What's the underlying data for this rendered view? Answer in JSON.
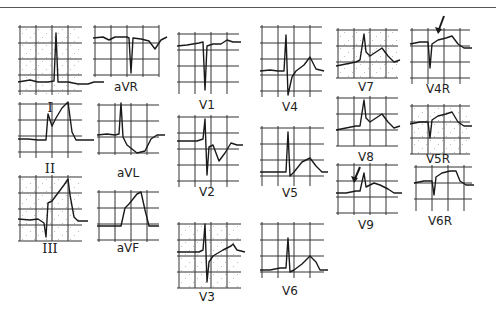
{
  "figure": {
    "colors": {
      "trace": "#1a1a1a",
      "grid": "#333333",
      "dots": "#999999",
      "background": "#ffffff"
    }
  },
  "leads": [
    {
      "id": "I",
      "label": "I",
      "x": 18,
      "y": 25,
      "w": 64,
      "h": 70,
      "lx": 50,
      "ly": 112,
      "roman": true,
      "trace": "M0,57 L12,55 L20,57 L30,57 L36,56 L38,8 L40,57 L50,57 L60,59 L70,59 L76,57 L86,57"
    },
    {
      "id": "aVR",
      "label": "aVR",
      "x": 93,
      "y": 25,
      "w": 66,
      "h": 52,
      "lx": 126,
      "ly": 92,
      "trace": "M0,13 L10,12 L16,15 L22,12 L34,12 L36,13 L38,48 L40,13 L48,14 L56,16 L62,24 L68,15 L74,12"
    },
    {
      "id": "II",
      "label": "II",
      "x": 18,
      "y": 102,
      "w": 64,
      "h": 56,
      "lx": 50,
      "ly": 173,
      "roman": true,
      "trace": "M0,37 L10,37 L20,38 L28,38 L30,12 L34,24 L38,16 L44,6 L50,0 L54,30 L58,38 L68,38 L76,38"
    },
    {
      "id": "aVL",
      "label": "aVL",
      "x": 97,
      "y": 103,
      "w": 62,
      "h": 52,
      "lx": 128,
      "ly": 178,
      "trace": "M0,32 L10,31 L18,32 L22,31 L24,0 L26,34 L30,42 L40,50 L48,48 L54,36 L60,32 L68,32"
    },
    {
      "id": "III",
      "label": "III",
      "x": 18,
      "y": 175,
      "w": 64,
      "h": 66,
      "lx": 50,
      "ly": 253,
      "roman": true,
      "trace": "M0,44 L12,45 L20,44 L26,48 L28,62 L30,28 L34,26 L40,18 L46,10 L50,4 L52,20 L56,42 L60,46 L70,46"
    },
    {
      "id": "aVF",
      "label": "aVF",
      "x": 97,
      "y": 190,
      "w": 62,
      "h": 52,
      "lx": 128,
      "ly": 253,
      "trace": "M0,36 L10,36 L24,36 L28,18 L32,14 L40,4 L44,2 L48,20 L52,36 L62,36"
    },
    {
      "id": "V1",
      "label": "V1",
      "x": 177,
      "y": 32,
      "w": 62,
      "h": 62,
      "lx": 207,
      "ly": 110,
      "trace": "M0,14 L10,13 L22,11 L26,10 L28,58 L30,14 L36,12 L44,12 L50,8 L56,10 L64,10"
    },
    {
      "id": "V2",
      "label": "V2",
      "x": 177,
      "y": 115,
      "w": 62,
      "h": 72,
      "lx": 207,
      "ly": 197,
      "trace": "M0,26 L10,26 L20,26 L26,24 L28,4 L30,60 L32,32 L36,30 L42,46 L48,38 L54,28 L60,30 L66,30"
    },
    {
      "id": "V3",
      "label": "V3",
      "x": 177,
      "y": 222,
      "w": 64,
      "h": 66,
      "lx": 207,
      "ly": 302,
      "trace": "M0,30 L12,30 L22,30 L26,28 L28,2 L30,60 L32,40 L36,34 L46,28 L54,24 L56,22 L60,28 L68,30"
    },
    {
      "id": "V4",
      "label": "V4",
      "x": 260,
      "y": 25,
      "w": 62,
      "h": 72,
      "lx": 290,
      "ly": 112,
      "trace": "M0,46 L10,45 L18,46 L24,46 L26,10 L28,70 L32,52 L36,46 L44,40 L50,32 L56,44 L64,46"
    },
    {
      "id": "V5",
      "label": "V5",
      "x": 260,
      "y": 126,
      "w": 64,
      "h": 60,
      "lx": 290,
      "ly": 198,
      "trace": "M0,46 L10,46 L20,46 L26,46 L28,6 L30,50 L34,46 L42,36 L50,32 L56,40 L62,46 L68,46"
    },
    {
      "id": "V6",
      "label": "V6",
      "x": 260,
      "y": 222,
      "w": 64,
      "h": 56,
      "lx": 290,
      "ly": 296,
      "trace": "M0,48 L10,48 L20,46 L26,46 L28,16 L30,50 L34,48 L42,42 L50,34 L56,40 L60,48 L68,48"
    },
    {
      "id": "V7",
      "label": "V7",
      "x": 336,
      "y": 28,
      "w": 62,
      "h": 50,
      "lx": 366,
      "ly": 92,
      "trace": "M0,38 L10,36 L20,34 L24,32 L28,6 L30,24 L34,28 L40,24 L46,20 L52,28 L58,34 L64,32"
    },
    {
      "id": "V8",
      "label": "V8",
      "x": 336,
      "y": 96,
      "w": 62,
      "h": 50,
      "lx": 366,
      "ly": 162,
      "trace": "M0,34 L10,32 L20,30 L24,30 L28,4 L30,22 L34,26 L40,22 L46,18 L52,26 L58,32 L64,30"
    },
    {
      "id": "V9",
      "label": "V9",
      "x": 336,
      "y": 163,
      "w": 62,
      "h": 52,
      "lx": 366,
      "ly": 230,
      "arrow": {
        "x1": 24,
        "y1": 4,
        "x2": 18,
        "y2": 18
      },
      "trace": "M0,30 L10,30 L20,28 L24,28 L28,10 L30,24 L34,22 L38,20 L44,22 L52,26 L58,30 L66,30"
    },
    {
      "id": "V4R",
      "label": "V4R",
      "x": 410,
      "y": 28,
      "w": 60,
      "h": 56,
      "lx": 438,
      "ly": 94,
      "arrow": {
        "x1": 34,
        "y1": -12,
        "x2": 28,
        "y2": 4
      },
      "trace": "M0,16 L10,14 L18,14 L20,40 L22,16 L28,12 L36,10 L42,8 L48,16 L54,20 L62,20"
    },
    {
      "id": "V5R",
      "label": "V5R",
      "x": 410,
      "y": 104,
      "w": 60,
      "h": 50,
      "lx": 438,
      "ly": 164,
      "trace": "M0,20 L10,18 L18,18 L20,34 L22,16 L28,12 L36,10 L42,8 L48,18 L54,22 L62,22"
    },
    {
      "id": "V6R",
      "label": "V6R",
      "x": 414,
      "y": 165,
      "w": 58,
      "h": 46,
      "lx": 440,
      "ly": 226,
      "trace": "M0,18 L10,16 L18,16 L20,30 L22,12 L28,8 L36,6 L42,6 L46,16 L52,20 L60,20"
    }
  ]
}
